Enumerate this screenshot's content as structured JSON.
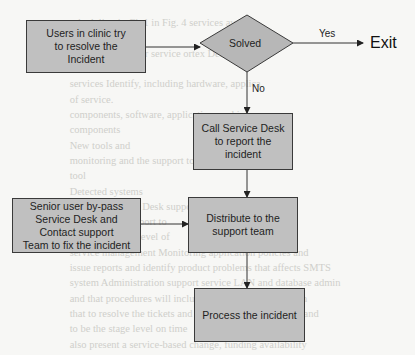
{
  "diagram": {
    "type": "flowchart",
    "nodes": {
      "users_try": {
        "label": "Users in clinic try to resolve the Incident",
        "lines": [
          "Users in clinic try",
          "to resolve the",
          "Incident"
        ],
        "shape": "rectangle"
      },
      "solved": {
        "label": "Solved",
        "shape": "diamond"
      },
      "exit": {
        "label": "Exit",
        "shape": "terminal-text"
      },
      "call_service_desk": {
        "label": "Call Service Desk to report the incident",
        "lines": [
          "Call Service Desk",
          "to report the",
          "incident"
        ],
        "shape": "rectangle"
      },
      "senior_user": {
        "label": "Senior user by-pass Service Desk and Contact support Team to fix the incident",
        "lines": [
          "Senior user by-pass",
          "Service Desk and",
          "Contact support",
          "Team to fix the incident"
        ],
        "shape": "rectangle"
      },
      "distribute": {
        "label": "Distribute to the support team",
        "lines": [
          "Distribute to the",
          "support team"
        ],
        "shape": "rectangle"
      },
      "process": {
        "label": "Process the incident",
        "lines": [
          "Process the incident"
        ],
        "shape": "rectangle"
      }
    },
    "edges": [
      {
        "from": "users_try",
        "to": "solved",
        "label": ""
      },
      {
        "from": "solved",
        "to": "exit",
        "label": "Yes"
      },
      {
        "from": "solved",
        "to": "call_service_desk",
        "label": "No"
      },
      {
        "from": "call_service_desk",
        "to": "distribute",
        "label": ""
      },
      {
        "from": "senior_user",
        "to": "distribute",
        "label": ""
      },
      {
        "from": "distribute",
        "to": "process",
        "label": ""
      }
    ],
    "colors": {
      "node_fill": "#c0c0c0",
      "node_border": "#3a3a3a",
      "line": "#333333",
      "background": "#f7f7f5"
    }
  },
  "background_text": [
    "                                                                    ",
    "                         scheduling in Ch 1 in Fig. 4 services availab",
    "                                                                    ",
    "                         Incident point user service ortex Detailed ov",
    "                         to be resolved.",
    "                         services Identify, including hardware, applica",
    "                         of service.",
    "                         components, software, application, and infor",
    "                         components",
    "                         New tools and",
    "                         monitoring and the support to review the plan anal",
    "                         tool",
    "                         Detected systems",
    "                         to a more HOTL Desk support center staff be",
    "                         maintain the support to",
    "                         the Highlighted level of",
    "                         service management Monitoring application policies and",
    "                         issue reports and identify product problems that affects SMTS",
    "                         system Administration support service LAN and database admin",
    "                         and that procedures will includes analysis and extraction",
    "                         that to resolve the tickets and the implementation of all and",
    "                         to be the stage level on time",
    "                         also present a service-based change, funding availability"
  ]
}
